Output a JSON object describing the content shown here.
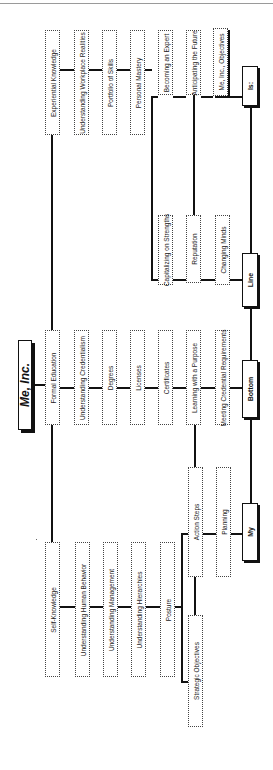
{
  "header": {
    "partial_text": "g   y  y"
  },
  "title": "Me, Inc.",
  "spine": [
    {
      "id": "my",
      "label": "My"
    },
    {
      "id": "bottom",
      "label": "Bottom"
    },
    {
      "id": "line",
      "label": "Line"
    },
    {
      "id": "is",
      "label": "Is:"
    }
  ],
  "columns": {
    "self_knowledge": [
      "Self-Knowledge",
      "Understanding Human Behavior",
      "Understanding Management",
      "Understanding Hierarchies",
      "Posture"
    ],
    "formal_education": [
      "Formal Education",
      "Understanding Credentialism",
      "Degrees",
      "Licenses",
      "Certificates",
      "Learning with a Purpose",
      "Meeting Credential Requirements"
    ],
    "experiential_knowledge": [
      "Experiential Knowledge",
      "Understanding Workplace Realities",
      "Portfolio of Skills",
      "Personal Mastery"
    ],
    "strategic": [
      "Strategic Objectives",
      "Action Steps",
      "Planning"
    ],
    "strengths": [
      "Capitalizing on Strengths",
      "Reputation",
      "Changing Minds"
    ],
    "expert": [
      "Becoming an Expert",
      "Anticipating the Future",
      "Me, Inc., Objectives"
    ]
  }
}
